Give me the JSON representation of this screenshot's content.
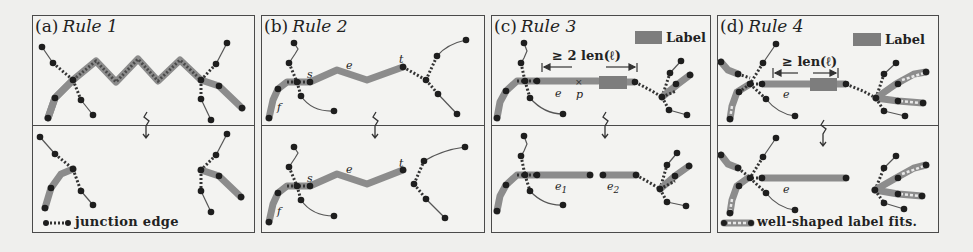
{
  "colors": {
    "background": "#efefed",
    "panel_border": "#4a4a4a",
    "thick_edge": "#8c8c8c",
    "node": "#1e1e1e",
    "thin_edge": "#555555",
    "label_box": "#7d7d7d",
    "well_shaped_inner": "#e8e8e8"
  },
  "panels": [
    {
      "id": "a",
      "prefix": "(a)",
      "rule": "Rule 1",
      "legend": "junction edge"
    },
    {
      "id": "b",
      "prefix": "(b)",
      "rule": "Rule 2",
      "annotations": {
        "s": "s",
        "e": "e",
        "t": "t",
        "f": "f"
      }
    },
    {
      "id": "c",
      "prefix": "(c)",
      "rule": "Rule 3",
      "label_key": "Label",
      "measure": "≥ 2 len(ℓ)",
      "annotations": {
        "e": "e",
        "p": "p",
        "e1": "e",
        "e1_sub": "1",
        "e2": "e",
        "e2_sub": "2"
      }
    },
    {
      "id": "d",
      "prefix": "(d)",
      "rule": "Rule 4",
      "label_key": "Label",
      "measure": "≥ len(ℓ)",
      "annotations": {
        "e_top": "e",
        "e_bottom": "e"
      },
      "legend": "well-shaped label fits."
    }
  ],
  "transform_arrow": "↯"
}
